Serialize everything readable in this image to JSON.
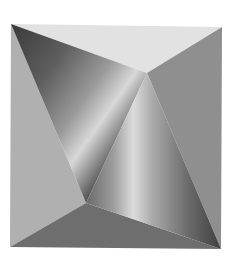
{
  "image": {
    "width": 230,
    "height": 273,
    "background": "#ffffff",
    "description": "Grayscale geometric illustration of a square divided into faceted triangular planes with two shaded cone-like surfaces"
  },
  "facets": {
    "top": {
      "points": "11,24 222,27 147,73",
      "fill": "#e2e2e2"
    },
    "right": {
      "points": "222,27 147,73 221,249",
      "fill": "#8f8f8f"
    },
    "left": {
      "points": "11,24 10,247 86,203",
      "fill": "#b0b0b0"
    },
    "bottom": {
      "points": "10,247 86,203 221,249",
      "fill": "#6e6e6e"
    },
    "upper_cone": {
      "points": "11,24 147,73 86,203",
      "gradient_stops": [
        "#3a3a3a",
        "#5e5e5e",
        "#9a9a9a",
        "#d8d8d8",
        "#8a8a8a",
        "#4a4a4a"
      ]
    },
    "lower_cone": {
      "points": "147,73 86,203 221,249",
      "gradient_stops": [
        "#6a6a6a",
        "#9c9c9c",
        "#dcdcdc",
        "#a8a8a8",
        "#6c6c6c",
        "#404040"
      ]
    }
  }
}
